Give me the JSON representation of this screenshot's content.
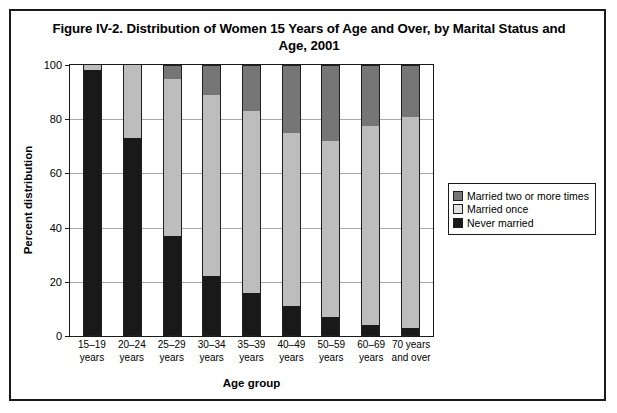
{
  "figure": {
    "title": "Figure IV-2. Distribution of Women 15 Years of Age and Over, by Marital Status and Age, 2001",
    "title_line1": "Figure IV-2. Distribution of Women 15 Years of Age and Over, by Marital Status",
    "title_line2": "and Age, 2001"
  },
  "legend": {
    "position": "right",
    "items": [
      {
        "label": "Married two or more times",
        "color": "#767676",
        "key": "married_two_or_more"
      },
      {
        "label": "Married once",
        "color": "#e2e2e2",
        "key": "married_once"
      },
      {
        "label": "Never married",
        "color": "#191919",
        "key": "never_married"
      }
    ]
  },
  "axes": {
    "y_title": "Percent distribution",
    "x_title": "Age group",
    "y_ticks": [
      "100",
      "80",
      "60",
      "40",
      "20",
      "0"
    ],
    "y_tick_values": [
      100,
      80,
      60,
      40,
      20,
      0
    ]
  },
  "x_labels": [
    {
      "line1": "15–19",
      "line2": "years"
    },
    {
      "line1": "20–24",
      "line2": "years"
    },
    {
      "line1": "25–29",
      "line2": "years"
    },
    {
      "line1": "30–34",
      "line2": "years"
    },
    {
      "line1": "35–39",
      "line2": "years"
    },
    {
      "line1": "40–49",
      "line2": "years"
    },
    {
      "line1": "50–59",
      "line2": "years"
    },
    {
      "line1": "60–69",
      "line2": "years"
    },
    {
      "line1": "70 years",
      "line2": "and over"
    }
  ],
  "chart_data": {
    "type": "bar",
    "subtype": "stacked-100-percent",
    "title": "Figure IV-2. Distribution of Women 15 Years of Age and Over, by Marital Status and Age, 2001",
    "xlabel": "Age group",
    "ylabel": "Percent distribution",
    "ylim": [
      0,
      100
    ],
    "ytick_step": 20,
    "grid": true,
    "legend_position": "right",
    "categories": [
      "15–19 years",
      "20–24 years",
      "25–29 years",
      "30–34 years",
      "35–39 years",
      "40–49 years",
      "50–59 years",
      "60–69 years",
      "70 years and over"
    ],
    "series": [
      {
        "name": "Never married",
        "color": "#191919",
        "values": [
          98,
          73,
          37,
          22,
          16,
          11,
          7,
          4,
          3
        ]
      },
      {
        "name": "Married once",
        "color": "#bdbdbd",
        "values": [
          2,
          27,
          58,
          67,
          67,
          64,
          65,
          73.5,
          78
        ]
      },
      {
        "name": "Married two or more times",
        "color": "#767676",
        "values": [
          0,
          0,
          5,
          11,
          17,
          25,
          28,
          22.5,
          19
        ]
      }
    ]
  }
}
